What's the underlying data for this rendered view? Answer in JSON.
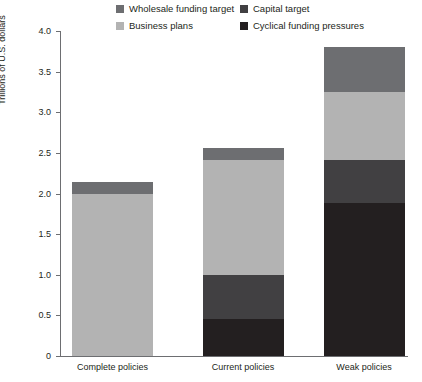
{
  "chart_data": {
    "type": "bar",
    "stacked": true,
    "title": "",
    "xlabel": "",
    "ylabel": "Trillions of U.S. dollars",
    "ylim": [
      0,
      4.0
    ],
    "yticks": [
      "0",
      "0.5",
      "1.0",
      "1.5",
      "2.0",
      "2.5",
      "3.0",
      "3.5",
      "4.0"
    ],
    "ytick_values": [
      0,
      0.5,
      1.0,
      1.5,
      2.0,
      2.5,
      3.0,
      3.5,
      4.0
    ],
    "grid": false,
    "legend_position": "top",
    "categories": [
      "Complete policies",
      "Current policies",
      "Weak policies"
    ],
    "series": [
      {
        "name": "Cyclical funding pressures",
        "color": "#231f20",
        "values": [
          0.0,
          0.45,
          1.88
        ]
      },
      {
        "name": "Capital target",
        "color": "#414042",
        "values": [
          0.0,
          0.55,
          0.53
        ]
      },
      {
        "name": "Business plans",
        "color": "#b3b3b3",
        "values": [
          2.0,
          1.41,
          0.84
        ]
      },
      {
        "name": "Wholesale funding target",
        "color": "#6d6e71",
        "values": [
          0.14,
          0.15,
          0.55
        ]
      }
    ],
    "totals": [
      2.14,
      2.56,
      3.8
    ]
  },
  "legend": {
    "items": [
      {
        "label": "Wholesale funding target",
        "color": "#6d6e71",
        "row": 0,
        "col": 0
      },
      {
        "label": "Capital target",
        "color": "#414042",
        "row": 0,
        "col": 1
      },
      {
        "label": "Business plans",
        "color": "#b3b3b3",
        "row": 1,
        "col": 0
      },
      {
        "label": "Cyclical funding pressures",
        "color": "#231f20",
        "row": 1,
        "col": 1
      }
    ]
  },
  "axis": {
    "y_title": "Trillions of U.S. dollars",
    "y_labels": [
      "4.0",
      "3.5",
      "3.0",
      "2.5",
      "2.0",
      "1.5",
      "1.0",
      "0.5",
      "0"
    ],
    "x_labels": [
      "Complete policies",
      "Current policies",
      "Weak policies"
    ],
    "axis_color": "#6d6e71"
  }
}
